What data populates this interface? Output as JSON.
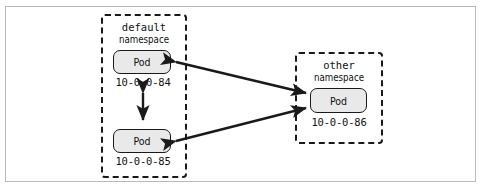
{
  "figure": {
    "background_color": "#ffffff",
    "frame_color": "#b9b9b9"
  },
  "namespaces": [
    {
      "id": "default",
      "name": "default",
      "word": "namespace",
      "border_style": "dashed",
      "border_color": "#1a1a1a",
      "pods": [
        {
          "id": "pod-84",
          "label": "Pod",
          "ip": "10-0-0-84"
        },
        {
          "id": "pod-85",
          "label": "Pod",
          "ip": "10-0-0-85"
        }
      ]
    },
    {
      "id": "other",
      "name": "other",
      "word": "namespace",
      "border_style": "dashed",
      "border_color": "#1a1a1a",
      "pods": [
        {
          "id": "pod-86",
          "label": "Pod",
          "ip": "10-0-0-86"
        }
      ]
    }
  ],
  "connections": [
    {
      "id": "conn-84-85",
      "from": "pod-84",
      "to": "pod-85",
      "arrow": "double",
      "orientation": "vertical"
    },
    {
      "id": "conn-84-86",
      "from": "pod-84",
      "to": "pod-86",
      "arrow": "double",
      "orientation": "diagonal"
    },
    {
      "id": "conn-85-86",
      "from": "pod-85",
      "to": "pod-86",
      "arrow": "double",
      "orientation": "diagonal"
    }
  ],
  "style": {
    "pod_fill": "#e9e9e9",
    "pod_border": "#1a1a1a",
    "arrow_color": "#1a1a1a"
  }
}
